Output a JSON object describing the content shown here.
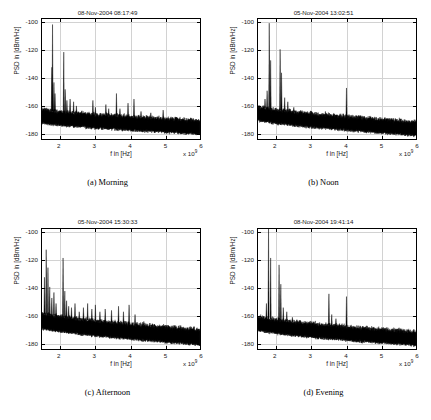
{
  "figure": {
    "background": "#ffffff",
    "trace_color": "#000000",
    "grid_color": "#d2d2d2",
    "axis_color": "#000000"
  },
  "panels": [
    {
      "key": "a",
      "caption": "(a)  Morning",
      "title": "08-Nov-2004 08:17:49",
      "chart_data": {
        "type": "line",
        "title": "08-Nov-2004 08:17:49",
        "xlabel": "f in [Hz]",
        "ylabel": "PSD in [dBm/Hz]",
        "x_exponent": "x 10",
        "x_exponent_power": "9",
        "xlim": [
          1.5,
          6.0
        ],
        "ylim": [
          -185,
          -98
        ],
        "xticks": [
          2,
          3,
          4,
          5,
          6
        ],
        "xticklabels": [
          "2",
          "3",
          "4",
          "5",
          "6"
        ],
        "yticks": [
          -100,
          -120,
          -140,
          -160,
          -180
        ],
        "yticklabels": [
          "-100",
          "-120",
          "-140",
          "-160",
          "-180"
        ],
        "grid": true,
        "noise_floor_start_db": -168,
        "noise_floor_end_db": -176,
        "noise_band_db": 9,
        "peaks": [
          {
            "f": 1.8,
            "db": -102
          },
          {
            "f": 1.78,
            "db": -133
          },
          {
            "f": 1.84,
            "db": -144
          },
          {
            "f": 1.87,
            "db": -152
          },
          {
            "f": 2.12,
            "db": -122
          },
          {
            "f": 2.16,
            "db": -149
          },
          {
            "f": 2.21,
            "db": -157
          },
          {
            "f": 2.3,
            "db": -156
          },
          {
            "f": 2.4,
            "db": -158
          },
          {
            "f": 2.48,
            "db": -161
          },
          {
            "f": 2.95,
            "db": -157
          },
          {
            "f": 3.02,
            "db": -162
          },
          {
            "f": 3.32,
            "db": -160
          },
          {
            "f": 3.4,
            "db": -163
          },
          {
            "f": 3.62,
            "db": -152
          },
          {
            "f": 3.72,
            "db": -163
          },
          {
            "f": 3.95,
            "db": -159
          },
          {
            "f": 4.12,
            "db": -156
          },
          {
            "f": 4.32,
            "db": -165
          },
          {
            "f": 4.6,
            "db": -166
          },
          {
            "f": 4.95,
            "db": -164
          },
          {
            "f": 5.3,
            "db": -169
          }
        ]
      }
    },
    {
      "key": "b",
      "caption": "(b)  Noon",
      "title": "05-Nov-2004 13:02:51",
      "chart_data": {
        "type": "line",
        "title": "05-Nov-2004 13:02:51",
        "xlabel": "f in [Hz]",
        "ylabel": "PSD in [dBm/Hz]",
        "x_exponent": "x 10",
        "x_exponent_power": "9",
        "xlim": [
          1.5,
          6.0
        ],
        "ylim": [
          -185,
          -98
        ],
        "xticks": [
          2,
          3,
          4,
          5,
          6
        ],
        "xticklabels": [
          "2",
          "3",
          "4",
          "5",
          "6"
        ],
        "yticks": [
          -100,
          -120,
          -140,
          -160,
          -180
        ],
        "yticklabels": [
          "-100",
          "-120",
          "-140",
          "-160",
          "-180"
        ],
        "grid": true,
        "noise_floor_start_db": -166,
        "noise_floor_end_db": -177,
        "noise_band_db": 9,
        "peaks": [
          {
            "f": 1.82,
            "db": -101
          },
          {
            "f": 1.86,
            "db": -128
          },
          {
            "f": 1.76,
            "db": -150
          },
          {
            "f": 1.7,
            "db": -156
          },
          {
            "f": 2.13,
            "db": -120
          },
          {
            "f": 2.17,
            "db": -137
          },
          {
            "f": 2.26,
            "db": -155
          },
          {
            "f": 2.35,
            "db": -158
          },
          {
            "f": 2.52,
            "db": -162
          },
          {
            "f": 2.7,
            "db": -165
          },
          {
            "f": 3.05,
            "db": -166
          },
          {
            "f": 3.42,
            "db": -165
          },
          {
            "f": 4.02,
            "db": -148
          },
          {
            "f": 4.3,
            "db": -168
          },
          {
            "f": 4.7,
            "db": -169
          },
          {
            "f": 5.2,
            "db": -170
          }
        ]
      }
    },
    {
      "key": "c",
      "caption": "(c)  Afternoon",
      "title": "05-Nov-2004 15:30:33",
      "chart_data": {
        "type": "line",
        "title": "05-Nov-2004 15:30:33",
        "xlabel": "f in [Hz]",
        "ylabel": "PSD in [dBm/Hz]",
        "x_exponent": "x 10",
        "x_exponent_power": "9",
        "xlim": [
          1.5,
          6.0
        ],
        "ylim": [
          -185,
          -98
        ],
        "xticks": [
          2,
          3,
          4,
          5,
          6
        ],
        "xticklabels": [
          "2",
          "3",
          "4",
          "5",
          "6"
        ],
        "yticks": [
          -100,
          -120,
          -140,
          -160,
          -180
        ],
        "yticklabels": [
          "-100",
          "-120",
          "-140",
          "-160",
          "-180"
        ],
        "grid": true,
        "noise_floor_start_db": -164,
        "noise_floor_end_db": -176,
        "noise_band_db": 10,
        "peaks": [
          {
            "f": 1.62,
            "db": -113
          },
          {
            "f": 1.57,
            "db": -133
          },
          {
            "f": 1.67,
            "db": -126
          },
          {
            "f": 1.72,
            "db": -140
          },
          {
            "f": 1.78,
            "db": -148
          },
          {
            "f": 1.84,
            "db": -144
          },
          {
            "f": 1.9,
            "db": -152
          },
          {
            "f": 2.1,
            "db": -119
          },
          {
            "f": 2.15,
            "db": -143
          },
          {
            "f": 2.2,
            "db": -150
          },
          {
            "f": 2.26,
            "db": -154
          },
          {
            "f": 2.34,
            "db": -155
          },
          {
            "f": 2.44,
            "db": -152
          },
          {
            "f": 2.56,
            "db": -158
          },
          {
            "f": 2.68,
            "db": -155
          },
          {
            "f": 2.8,
            "db": -152
          },
          {
            "f": 2.92,
            "db": -156
          },
          {
            "f": 3.02,
            "db": -153
          },
          {
            "f": 3.15,
            "db": -158
          },
          {
            "f": 3.3,
            "db": -156
          },
          {
            "f": 3.48,
            "db": -157
          },
          {
            "f": 3.68,
            "db": -154
          },
          {
            "f": 3.82,
            "db": -158
          },
          {
            "f": 3.98,
            "db": -153
          },
          {
            "f": 4.15,
            "db": -160
          },
          {
            "f": 4.4,
            "db": -165
          },
          {
            "f": 4.7,
            "db": -167
          },
          {
            "f": 5.1,
            "db": -168
          }
        ]
      }
    },
    {
      "key": "d",
      "caption": "(d)  Evening",
      "title": "08-Nov-2004 19:41:14",
      "chart_data": {
        "type": "line",
        "title": "08-Nov-2004 19:41:14",
        "xlabel": "f in [Hz]",
        "ylabel": "PSD in [dBm/Hz]",
        "x_exponent": "x 10",
        "x_exponent_power": "9",
        "xlim": [
          1.5,
          6.0
        ],
        "ylim": [
          -185,
          -98
        ],
        "xticks": [
          2,
          3,
          4,
          5,
          6
        ],
        "xticklabels": [
          "2",
          "3",
          "4",
          "5",
          "6"
        ],
        "yticks": [
          -100,
          -120,
          -140,
          -160,
          -180
        ],
        "yticklabels": [
          "-100",
          "-120",
          "-140",
          "-160",
          "-180"
        ],
        "grid": true,
        "noise_floor_start_db": -166,
        "noise_floor_end_db": -177,
        "noise_band_db": 9,
        "peaks": [
          {
            "f": 1.8,
            "db": -98
          },
          {
            "f": 1.86,
            "db": -119
          },
          {
            "f": 1.74,
            "db": -152
          },
          {
            "f": 2.1,
            "db": -124
          },
          {
            "f": 2.15,
            "db": -138
          },
          {
            "f": 2.22,
            "db": -155
          },
          {
            "f": 2.32,
            "db": -158
          },
          {
            "f": 2.48,
            "db": -162
          },
          {
            "f": 2.7,
            "db": -164
          },
          {
            "f": 3.52,
            "db": -145
          },
          {
            "f": 3.6,
            "db": -160
          },
          {
            "f": 3.72,
            "db": -163
          },
          {
            "f": 4.02,
            "db": -147
          },
          {
            "f": 4.35,
            "db": -168
          },
          {
            "f": 4.8,
            "db": -169
          },
          {
            "f": 5.4,
            "db": -171
          }
        ]
      }
    }
  ]
}
